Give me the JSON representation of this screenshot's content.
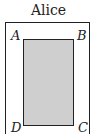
{
  "title": "Alice",
  "vertices": {
    "a": "A",
    "b": "B",
    "c": "C",
    "d": "D"
  },
  "colors": {
    "fill": "#cfcfcf",
    "stroke": "#222222"
  }
}
